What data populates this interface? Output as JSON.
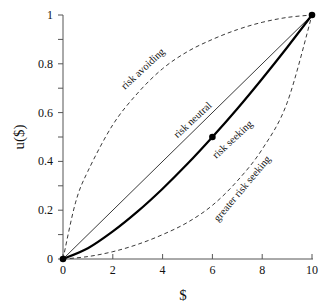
{
  "chart_data": {
    "type": "line",
    "title": "",
    "xlabel": "$",
    "ylabel": "u($)",
    "xlim": [
      0,
      10
    ],
    "ylim": [
      0,
      1
    ],
    "x_ticks": [
      0,
      2,
      4,
      6,
      8,
      10
    ],
    "x_tick_labels": [
      "0",
      "2",
      "4",
      "6",
      "8",
      "10"
    ],
    "y_ticks": [
      0,
      0.1,
      0.2,
      0.3,
      0.4,
      0.5,
      0.6,
      0.7,
      0.8,
      0.9,
      1
    ],
    "y_tick_labels": [
      "0",
      "",
      "0.2",
      "",
      "0.4",
      "",
      "0.6",
      "",
      "0.8",
      "",
      "1"
    ],
    "grid": false,
    "legend": null,
    "series": [
      {
        "name": "risk avoiding",
        "style": "dashed",
        "x": [
          0,
          0.5,
          1,
          2,
          3,
          4,
          5,
          6,
          7,
          8,
          9,
          10
        ],
        "values": [
          0,
          0.23,
          0.36,
          0.55,
          0.68,
          0.78,
          0.85,
          0.9,
          0.94,
          0.97,
          0.99,
          1
        ]
      },
      {
        "name": "risk neutral",
        "style": "thin-solid",
        "x": [
          0,
          10
        ],
        "values": [
          0,
          1
        ]
      },
      {
        "name": "risk seeking",
        "style": "thick-solid",
        "x": [
          0,
          1,
          2,
          3,
          4,
          5,
          6,
          7,
          8,
          9,
          10
        ],
        "values": [
          0,
          0.044,
          0.113,
          0.195,
          0.288,
          0.39,
          0.5,
          0.616,
          0.739,
          0.867,
          1
        ]
      },
      {
        "name": "greater risk seeking",
        "style": "dashed",
        "x": [
          0,
          1,
          2,
          3,
          4,
          5,
          6,
          7,
          8,
          9,
          10
        ],
        "values": [
          0,
          0.01,
          0.03,
          0.06,
          0.1,
          0.15,
          0.22,
          0.32,
          0.45,
          0.64,
          1
        ]
      }
    ],
    "annotations": [
      {
        "text": "risk avoiding",
        "x": 3.3,
        "y": 0.77,
        "rotation": -43
      },
      {
        "text": "risk neutral",
        "x": 5.3,
        "y": 0.56,
        "rotation": -43
      },
      {
        "text": "risk seeking",
        "x": 6.9,
        "y": 0.48,
        "rotation": -43
      },
      {
        "text": "greater risk seeking",
        "x": 7.3,
        "y": 0.28,
        "rotation": -50
      }
    ],
    "points": [
      {
        "x": 0,
        "y": 0
      },
      {
        "x": 6,
        "y": 0.5
      },
      {
        "x": 10,
        "y": 1
      }
    ]
  }
}
